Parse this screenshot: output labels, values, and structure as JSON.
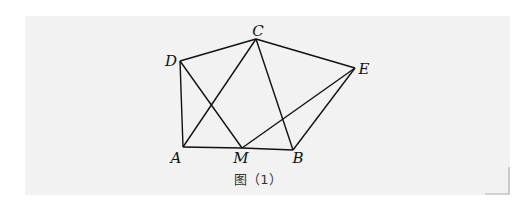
{
  "figure": {
    "caption": "图（1）",
    "points": {
      "A": {
        "label": "A",
        "x": 183,
        "y": 147,
        "lx": 176,
        "ly": 163
      },
      "M": {
        "label": "M",
        "x": 242,
        "y": 148,
        "lx": 241,
        "ly": 163
      },
      "B": {
        "label": "B",
        "x": 293,
        "y": 150,
        "lx": 298,
        "ly": 163
      },
      "C": {
        "label": "C",
        "x": 256,
        "y": 39,
        "lx": 258,
        "ly": 36
      },
      "D": {
        "label": "D",
        "x": 180,
        "y": 61,
        "lx": 171,
        "ly": 66
      },
      "E": {
        "label": "E",
        "x": 355,
        "y": 68,
        "lx": 364,
        "ly": 74
      }
    },
    "segments": [
      [
        "D",
        "C"
      ],
      [
        "C",
        "E"
      ],
      [
        "D",
        "A"
      ],
      [
        "A",
        "M"
      ],
      [
        "M",
        "B"
      ],
      [
        "B",
        "E"
      ],
      [
        "D",
        "M"
      ],
      [
        "A",
        "C"
      ],
      [
        "C",
        "B"
      ],
      [
        "M",
        "E"
      ]
    ],
    "colors": {
      "panel": "#f2f2f2",
      "stroke": "#111111",
      "bracket": "#b0b0b0"
    }
  }
}
